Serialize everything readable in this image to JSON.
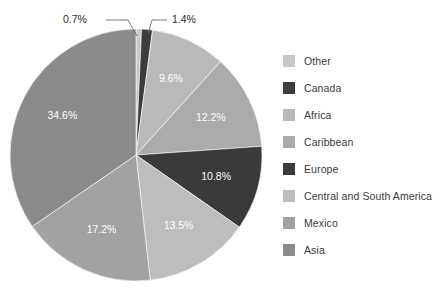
{
  "chart_data": {
    "type": "pie",
    "title": "",
    "legend_position": "right",
    "grid": false,
    "start_angle_deg": 0,
    "direction": "clockwise",
    "categories": [
      "Other",
      "Canada",
      "Africa",
      "Caribbean",
      "Europe",
      "Central and South America",
      "Mexico",
      "Asia"
    ],
    "values": [
      0.7,
      1.4,
      9.6,
      12.2,
      10.8,
      13.5,
      17.2,
      34.6
    ],
    "unit": "%",
    "slices": [
      {
        "label": "Other",
        "value": 0.7,
        "display": "0.7%",
        "color": "#c8c8c8",
        "label_placement": "callout-left",
        "label_color": "#2b2b2b"
      },
      {
        "label": "Canada",
        "value": 1.4,
        "display": "1.4%",
        "color": "#3c3c3c",
        "label_placement": "callout-right",
        "label_color": "#2b2b2b"
      },
      {
        "label": "Africa",
        "value": 9.6,
        "display": "9.6%",
        "color": "#b9b9b9",
        "label_placement": "inside",
        "label_color": "#ffffff"
      },
      {
        "label": "Caribbean",
        "value": 12.2,
        "display": "12.2%",
        "color": "#ababab",
        "label_placement": "inside",
        "label_color": "#ffffff"
      },
      {
        "label": "Europe",
        "value": 10.8,
        "display": "10.8%",
        "color": "#3a3a3a",
        "label_placement": "inside",
        "label_color": "#ffffff"
      },
      {
        "label": "Central and South America",
        "value": 13.5,
        "display": "13.5%",
        "color": "#bdbdbd",
        "label_placement": "inside",
        "label_color": "#ffffff"
      },
      {
        "label": "Mexico",
        "value": 17.2,
        "display": "17.2%",
        "color": "#a2a2a2",
        "label_placement": "inside",
        "label_color": "#ffffff"
      },
      {
        "label": "Asia",
        "value": 34.6,
        "display": "34.6%",
        "color": "#8b8b8b",
        "label_placement": "inside",
        "label_color": "#ffffff"
      }
    ]
  },
  "legend": {
    "items": [
      {
        "label": "Other",
        "color": "#c8c8c8"
      },
      {
        "label": "Canada",
        "color": "#3c3c3c"
      },
      {
        "label": "Africa",
        "color": "#b9b9b9"
      },
      {
        "label": "Caribbean",
        "color": "#ababab"
      },
      {
        "label": "Europe",
        "color": "#3a3a3a"
      },
      {
        "label": "Central and South America",
        "color": "#bdbdbd"
      },
      {
        "label": "Mexico",
        "color": "#a2a2a2"
      },
      {
        "label": "Asia",
        "color": "#8b8b8b"
      }
    ]
  },
  "callouts": [
    {
      "text": "0.7%"
    },
    {
      "text": "1.4%"
    }
  ],
  "background_color": "#ffffff"
}
